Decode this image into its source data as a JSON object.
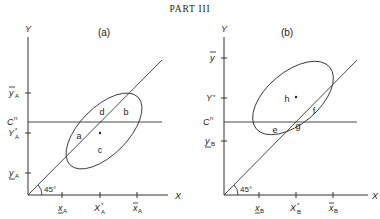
{
  "header": {
    "title": "PART III"
  },
  "panels": [
    {
      "id": "a",
      "label": "(a)",
      "y_axis_label": "Y",
      "x_axis_label": "X",
      "angle_label": "45°",
      "cn_label": "Cⁿ",
      "y_ticks": [
        {
          "label_main": "y",
          "label_sub": "A",
          "decoration": "overbar",
          "y": 93
        },
        {
          "label_main": "Y",
          "label_sub": "A",
          "decoration": "star",
          "y": 133
        },
        {
          "label_main": "y",
          "label_sub": "A",
          "decoration": "underbar",
          "y": 173
        }
      ],
      "x_ticks": [
        {
          "label_main": "x",
          "label_sub": "A",
          "decoration": "underbar",
          "x": 62
        },
        {
          "label_main": "X",
          "label_sub": "A",
          "decoration": "star",
          "x": 100
        },
        {
          "label_main": "x",
          "label_sub": "A",
          "decoration": "overbar",
          "x": 137
        }
      ],
      "regions": [
        {
          "label": "a",
          "x": 79,
          "y": 138
        },
        {
          "label": "b",
          "x": 126,
          "y": 114
        },
        {
          "label": "c",
          "x": 100,
          "y": 152
        },
        {
          "label": "d",
          "x": 102,
          "y": 114
        }
      ],
      "center_point": {
        "x": 100,
        "y": 133
      }
    },
    {
      "id": "b",
      "label": "(b)",
      "y_axis_label": "Y",
      "x_axis_label": "X",
      "angle_label": "45°",
      "cn_label": "Cⁿ",
      "y_ticks": [
        {
          "label_main": "y",
          "label_sub": "",
          "decoration": "overbar",
          "y": 58
        },
        {
          "label_main": "Y",
          "label_sub": "",
          "decoration": "star",
          "y": 98
        },
        {
          "label_main": "y",
          "label_sub": "B",
          "decoration": "underbar",
          "y": 141
        }
      ],
      "x_ticks": [
        {
          "label_main": "x",
          "label_sub": "B",
          "decoration": "underbar",
          "x": 259
        },
        {
          "label_main": "X",
          "label_sub": "B",
          "decoration": "star",
          "x": 296
        },
        {
          "label_main": "x",
          "label_sub": "B",
          "decoration": "overbar",
          "x": 333
        }
      ],
      "regions": [
        {
          "label": "e",
          "x": 275,
          "y": 132
        },
        {
          "label": "f",
          "x": 314,
          "y": 113
        },
        {
          "label": "g",
          "x": 298,
          "y": 128
        },
        {
          "label": "h",
          "x": 287,
          "y": 101
        }
      ],
      "center_point": {
        "x": 296,
        "y": 97
      }
    }
  ],
  "text": {
    "panel_a_label": "(a)",
    "panel_b_label": "(b)",
    "y_label": "Y",
    "x_label": "X",
    "angle": "45°",
    "cn_main": "C",
    "cn_sup": "n",
    "ya_bar": "y",
    "ya_star": "Y",
    "ya_under": "y",
    "sub_A": "A",
    "sub_B": "B",
    "yb_bar": "y",
    "yb_star": "Y",
    "yb_under": "y",
    "x_lower": "x",
    "x_star": "X",
    "star": "*",
    "region_a": "a",
    "region_b": "b",
    "region_c": "c",
    "region_d": "d",
    "region_e": "e",
    "region_f": "f",
    "region_g": "g",
    "region_h": "h"
  }
}
